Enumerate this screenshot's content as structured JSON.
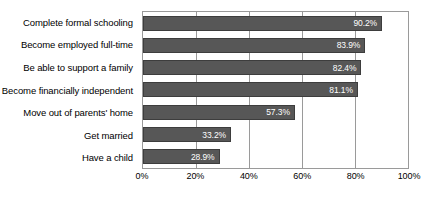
{
  "chart_data": {
    "type": "bar",
    "orientation": "horizontal",
    "title": "",
    "xlabel": "",
    "ylabel": "",
    "xlim": [
      0,
      100
    ],
    "grid": true,
    "legend": false,
    "xtick_labels": [
      "0%",
      "20%",
      "40%",
      "60%",
      "80%",
      "100%"
    ],
    "xtick_values": [
      0,
      20,
      40,
      60,
      80,
      100
    ],
    "categories": [
      "Complete formal schooling",
      "Become employed full-time",
      "Be able to support a family",
      "Become financially independent",
      "Move out of parents' home",
      "Get married",
      "Have a child"
    ],
    "values": [
      90.2,
      83.9,
      82.4,
      81.1,
      57.3,
      33.2,
      28.9
    ],
    "value_labels": [
      "90.2%",
      "83.9%",
      "82.4%",
      "81.1%",
      "57.3%",
      "33.2%",
      "28.9%"
    ],
    "colors": {
      "bar_fill": "#575757",
      "bar_border": "#3d3d3d",
      "value_label": "#ffffff",
      "category_label": "#000000",
      "gridline": "#9a9a9a",
      "plot_border": "#9a9a9a",
      "background": "#ffffff"
    }
  }
}
